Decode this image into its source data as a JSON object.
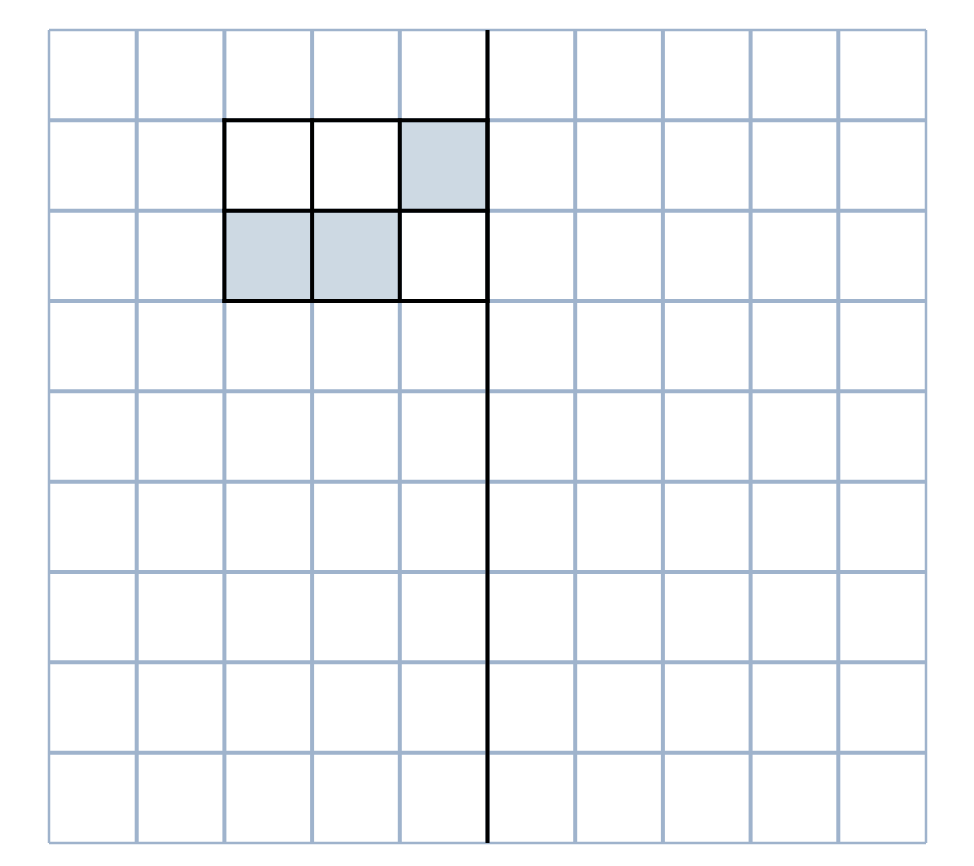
{
  "diagram": {
    "type": "grid-shading",
    "columns": 10,
    "rows": 9,
    "bounds": {
      "left": 49,
      "top": 30,
      "right": 926,
      "bottom": 843
    },
    "colors": {
      "background": "#ffffff",
      "grid_line": "#9fb3cc",
      "outline": "#000000",
      "shaded_fill": "#cdd9e3"
    },
    "grid_line_width": 4,
    "outline_width": 4,
    "outlined_region": {
      "col_start": 2,
      "row_start": 1,
      "cols": 3,
      "rows": 2
    },
    "shaded_cells": [
      {
        "col": 4,
        "row": 1
      },
      {
        "col": 2,
        "row": 2
      },
      {
        "col": 3,
        "row": 2
      }
    ],
    "divider_line": {
      "orientation": "vertical",
      "col_boundary": 5
    }
  }
}
